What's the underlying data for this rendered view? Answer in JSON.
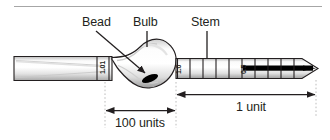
{
  "diagram": {
    "callouts": [
      {
        "id": "bead",
        "label": "Bead"
      },
      {
        "id": "bulb",
        "label": "Bulb"
      },
      {
        "id": "stem",
        "label": "Stem"
      }
    ],
    "scale_marks": [
      {
        "id": "mark-101",
        "label": "1.01"
      },
      {
        "id": "mark-10",
        "label": "1.0"
      },
      {
        "id": "mark-05",
        "label": "0.5"
      }
    ],
    "dimensions": [
      {
        "id": "dim-100-units",
        "label": "100 units"
      },
      {
        "id": "dim-1-unit",
        "label": "1 unit"
      }
    ],
    "colors": {
      "outline": "#231f20",
      "glass_light": "#f4f4f4",
      "glass_mid": "#d2d2d2",
      "glass_shadow": "#9a9a9a",
      "bead": "#000000",
      "guide": "#b8b8b8",
      "background": "#ffffff"
    }
  }
}
